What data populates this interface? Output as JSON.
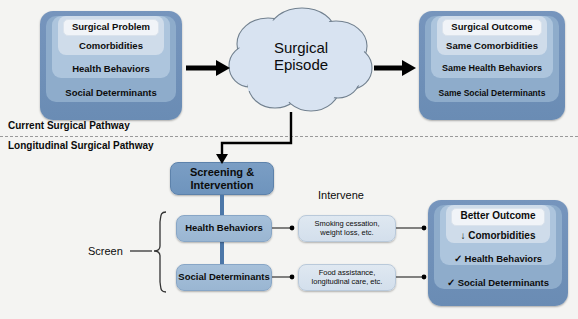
{
  "diagram": {
    "background_color": "#f4f4f2"
  },
  "dividers": {
    "top_label": "Current Surgical Pathway",
    "bottom_label": "Longitudinal Surgical Pathway"
  },
  "top_pathway": {
    "input_stack": {
      "name": "Preoperative Patient Factors",
      "rows": [
        "Surgical Problem",
        "Comorbidities",
        "Health Behaviors",
        "Social Determinants"
      ]
    },
    "cloud": {
      "label": "Surgical\nEpisode"
    },
    "output_stack": {
      "name": "Postoperative Status",
      "rows": [
        "Surgical Outcome",
        "Same Comorbidities",
        "Same Health Behaviors",
        "Same Social Determinants"
      ]
    }
  },
  "bottom_pathway": {
    "screening_box": "Screening &\nIntervention",
    "screen_label": "Screen",
    "intervene_label": "Intervene",
    "screen_items": [
      "Health Behaviors",
      "Social Determinants"
    ],
    "interventions": [
      "Smoking cessation,\nweight loss, etc.",
      "Food assistance,\nlongitudinal care, etc."
    ],
    "outcome_stack": {
      "name": "Improved Postoperative Status",
      "rows": [
        "Better Outcome",
        "↓ Comorbidities",
        "✓ Health Behaviors",
        "✓ Social Determinants"
      ]
    }
  },
  "colors": {
    "stack_outer": "#6d92bb",
    "stack_l2": "#89a7c8",
    "stack_l3": "#a8c1d9",
    "stack_l4": "#c6d6e5",
    "stack_inner": "#eef2f7",
    "cloud_fill": "#d6e2f0",
    "cloud_stroke": "#6f7c8c",
    "connector_blue": "#4c77a8",
    "arrow_black": "#000000",
    "divider_dash": "#9a9a9a"
  }
}
